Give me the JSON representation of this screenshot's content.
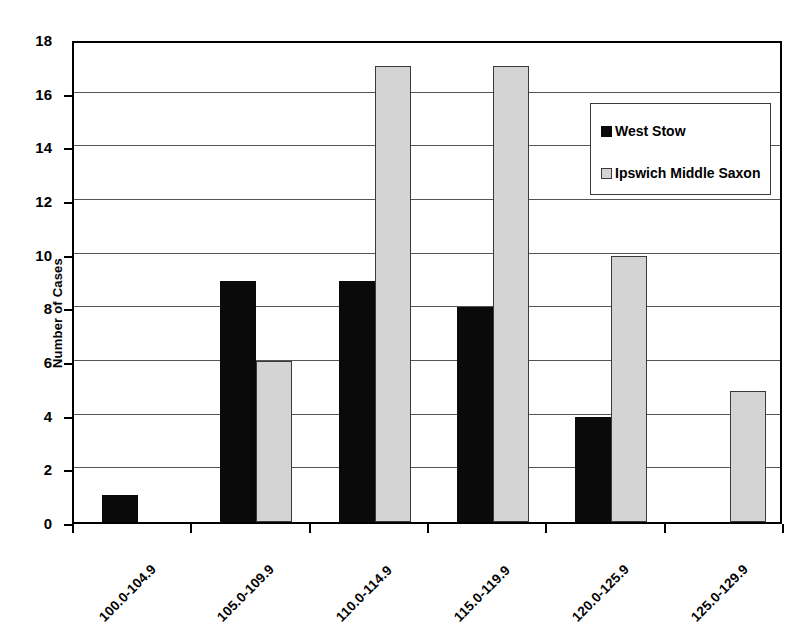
{
  "chart_data": {
    "type": "bar",
    "title": "",
    "xlabel": "",
    "ylabel": "Number of Cases",
    "ylim": [
      0,
      18
    ],
    "ytick_step": 2,
    "yticks": [
      0,
      2,
      4,
      6,
      8,
      10,
      12,
      14,
      16,
      18
    ],
    "grid": true,
    "grid_axis": "y",
    "legend_position": "top-right",
    "categories": [
      "100.0-104.9",
      "105.0-109.9",
      "110.0-114.9",
      "115.0-119.9",
      "120.0-125.9",
      "125.0-129.9"
    ],
    "series": [
      {
        "name": "West Stow",
        "color": "#0a0a0a",
        "values": [
          1,
          9,
          9,
          8,
          3.9,
          0
        ]
      },
      {
        "name": "Ipswich Middle Saxon",
        "color": "#d4d4d4",
        "values": [
          0,
          6,
          17,
          17,
          9.9,
          4.9
        ]
      }
    ]
  },
  "axes": {
    "y_title": "Number of Cases",
    "y_tick_labels": [
      "0",
      "2",
      "4",
      "6",
      "8",
      "10",
      "12",
      "14",
      "16",
      "18"
    ],
    "x_tick_labels": [
      "100.0-104.9",
      "105.0-109.9",
      "110.0-114.9",
      "115.0-119.9",
      "120.0-125.9",
      "125.0-129.9"
    ]
  },
  "legend": {
    "entries": [
      {
        "label": "West Stow",
        "swatch": "black-square-icon"
      },
      {
        "label": "Ipswich Middle Saxon",
        "swatch": "gray-square-icon"
      }
    ]
  },
  "colors": {
    "series_west_stow": "#0a0a0a",
    "series_ipswich": "#d4d4d4",
    "axis": "#000000",
    "gridline": "#555555",
    "background": "#ffffff"
  }
}
